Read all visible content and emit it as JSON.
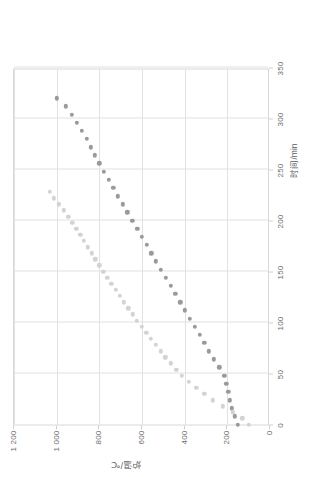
{
  "chart_data": {
    "type": "scatter",
    "title": "",
    "xlabel": "时间/min",
    "ylabel": "炉温/℃",
    "xlim": [
      0,
      350
    ],
    "ylim": [
      0,
      1200
    ],
    "xticks": [
      0,
      50,
      100,
      150,
      200,
      250,
      300,
      350
    ],
    "xtick_labels": [
      "0",
      "50",
      "100",
      "150",
      "200",
      "250",
      "300",
      "350"
    ],
    "yticks": [
      0,
      200,
      400,
      600,
      800,
      1000,
      1200
    ],
    "ytick_labels": [
      "0",
      "200",
      "400",
      "600",
      "800",
      "1 000",
      "1 200"
    ],
    "grid": true,
    "legend_position": "none",
    "series": [
      {
        "name": "series-a",
        "color": "#9a9a9a",
        "marker": "circle",
        "points": [
          [
            0,
            150
          ],
          [
            8,
            165
          ],
          [
            16,
            178
          ],
          [
            24,
            188
          ],
          [
            32,
            196
          ],
          [
            40,
            205
          ],
          [
            48,
            215
          ],
          [
            56,
            238
          ],
          [
            64,
            262
          ],
          [
            72,
            286
          ],
          [
            80,
            308
          ],
          [
            88,
            330
          ],
          [
            96,
            352
          ],
          [
            104,
            375
          ],
          [
            112,
            398
          ],
          [
            120,
            420
          ],
          [
            128,
            443
          ],
          [
            136,
            466
          ],
          [
            144,
            489
          ],
          [
            152,
            512
          ],
          [
            160,
            534
          ],
          [
            168,
            556
          ],
          [
            176,
            578
          ],
          [
            184,
            600
          ],
          [
            192,
            622
          ],
          [
            200,
            645
          ],
          [
            208,
            668
          ],
          [
            216,
            690
          ],
          [
            224,
            712
          ],
          [
            232,
            734
          ],
          [
            240,
            756
          ],
          [
            248,
            778
          ],
          [
            256,
            800
          ],
          [
            264,
            820
          ],
          [
            272,
            840
          ],
          [
            280,
            860
          ],
          [
            288,
            882
          ],
          [
            296,
            906
          ],
          [
            304,
            930
          ],
          [
            312,
            958
          ],
          [
            320,
            1000
          ]
        ]
      },
      {
        "name": "series-b",
        "color": "#d3d3d3",
        "marker": "circle",
        "points": [
          [
            0,
            100
          ],
          [
            6,
            130
          ],
          [
            12,
            175
          ],
          [
            18,
            222
          ],
          [
            24,
            268
          ],
          [
            30,
            308
          ],
          [
            36,
            345
          ],
          [
            42,
            380
          ],
          [
            48,
            412
          ],
          [
            54,
            440
          ],
          [
            60,
            466
          ],
          [
            66,
            490
          ],
          [
            72,
            513
          ],
          [
            78,
            536
          ],
          [
            84,
            558
          ],
          [
            90,
            580
          ],
          [
            96,
            602
          ],
          [
            102,
            623
          ],
          [
            108,
            644
          ],
          [
            114,
            665
          ],
          [
            120,
            685
          ],
          [
            126,
            705
          ],
          [
            132,
            724
          ],
          [
            138,
            743
          ],
          [
            144,
            762
          ],
          [
            150,
            781
          ],
          [
            156,
            800
          ],
          [
            162,
            818
          ],
          [
            168,
            836
          ],
          [
            174,
            854
          ],
          [
            180,
            872
          ],
          [
            186,
            890
          ],
          [
            192,
            908
          ],
          [
            198,
            926
          ],
          [
            204,
            945
          ],
          [
            210,
            966
          ],
          [
            216,
            990
          ],
          [
            222,
            1012
          ],
          [
            228,
            1032
          ]
        ]
      }
    ]
  }
}
